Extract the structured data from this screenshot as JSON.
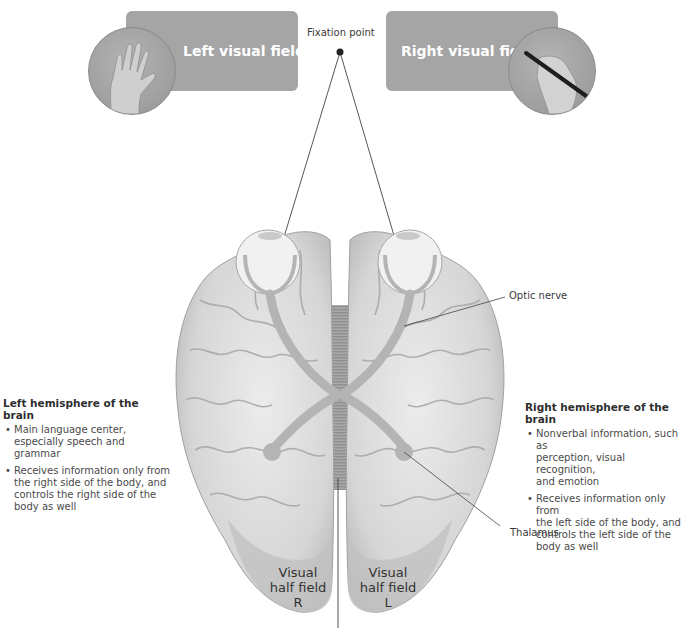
{
  "visual_fields": {
    "left": {
      "label": "Left visual field",
      "photo": "hand-icon"
    },
    "right": {
      "label": "Right visual field",
      "photo": "hand-writing-pen-icon"
    }
  },
  "fixation": {
    "label": "Fixation point"
  },
  "labels": {
    "optic_nerve": "Optic nerve",
    "thalamus": "Thalamus"
  },
  "left_hemisphere": {
    "title": "Left hemisphere of the brain",
    "bullets": [
      "Main language center, especially speech and grammar",
      "Receives information only from the right side of the body, and controls the right side of the body as well"
    ],
    "lines": [
      [
        "Main language center,",
        "especially speech and grammar"
      ],
      [
        "Receives information only from",
        "the right side of the body, and",
        "controls the right side of the",
        "body as well"
      ]
    ]
  },
  "right_hemisphere": {
    "title": "Right hemisphere of the brain",
    "bullets": [
      "Nonverbal information, such as perception, visual recognition, and emotion",
      "Receives information only from the left side of the body, and controls the left side of the body as well"
    ],
    "lines": [
      [
        "Nonverbal information, such as",
        "perception, visual recognition,",
        "and emotion"
      ],
      [
        "Receives information only from",
        "the left side of the body, and",
        "controls the left side of the",
        "body as well"
      ]
    ]
  },
  "visual_half_fields": {
    "right": {
      "line1": "Visual",
      "line2": "half field",
      "line3": "R"
    },
    "left": {
      "line1": "Visual",
      "line2": "half field",
      "line3": "L"
    }
  },
  "colors": {
    "field_box": "#a5a5a5",
    "brain_fill": "#dcdcdc",
    "brain_shadow": "#b9b9b9",
    "optic_path": "#b4b4b4",
    "text": "#3a3a3a"
  }
}
